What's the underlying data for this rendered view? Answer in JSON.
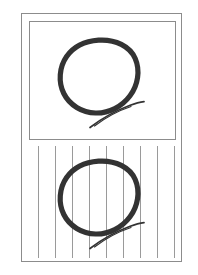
{
  "figure": {
    "canvas": {
      "width": 198,
      "height": 275,
      "background": "#ffffff"
    },
    "outer_frame": {
      "label": "outer page border",
      "x": 21,
      "y": 13,
      "width": 161,
      "height": 249,
      "stroke_color": "#8c8c8c",
      "stroke_width": 1,
      "fill_color": "#ffffff"
    },
    "panels": [
      {
        "id": "plain",
        "label": "plain white panel",
        "x": 29,
        "y": 21,
        "width": 147,
        "height": 119,
        "border_color": "#8c8c8c",
        "background_color": "#ffffff",
        "background_type": "plain",
        "stripes": 0
      },
      {
        "id": "striped",
        "label": "vertically ruled panel",
        "x": 22,
        "y": 141,
        "width": 159,
        "height": 120,
        "border_color": "none",
        "background_color": "#ffffff",
        "background_type": "vertical-lines",
        "stripes": 9,
        "stripe_color": "#9a9a9a",
        "stripe_width": 1,
        "stripe_top_inset": 5,
        "stripe_height": 112,
        "stripe_x_positions": [
          16,
          33,
          50,
          67,
          84,
          101,
          118,
          135,
          152
        ]
      }
    ],
    "glyphs": [
      {
        "id": "glyph-plain",
        "label": "handwritten letter Q on plain background",
        "character": "Q",
        "panel": "plain",
        "x": 53,
        "y": 33,
        "width": 100,
        "height": 104,
        "stroke_color": "#333333",
        "bowl_stroke_width": 5.2,
        "tail_stroke_width": 1.6
      },
      {
        "id": "glyph-striped",
        "label": "handwritten letter Q on ruled background",
        "character": "Q",
        "panel": "striped",
        "x": 53,
        "y": 154,
        "width": 100,
        "height": 104,
        "stroke_color": "#333333",
        "bowl_stroke_width": 5.2,
        "tail_stroke_width": 1.6
      }
    ],
    "colors": {
      "frame": "#8c8c8c",
      "stripe": "#9a9a9a",
      "ink": "#333333",
      "paper": "#ffffff"
    }
  }
}
